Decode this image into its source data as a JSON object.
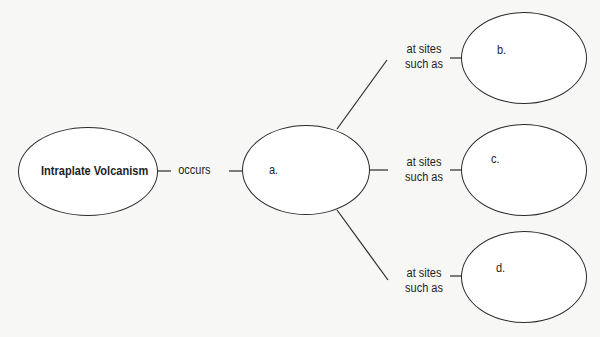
{
  "diagram": {
    "type": "concept-map",
    "colors": {
      "background": "#f7f7f5",
      "node_fill": "#ffffff",
      "stroke": "#2a2a2a",
      "text": "#1e1e1e"
    },
    "root": {
      "id": "root",
      "label": "Intraplate Volcanism"
    },
    "links": {
      "occurs": "occurs",
      "sites_b_line1": "at sites",
      "sites_b_line2": "such as",
      "sites_c_line1": "at sites",
      "sites_c_line2": "such as",
      "sites_d_line1": "at sites",
      "sites_d_line2": "such as"
    },
    "nodes": {
      "a": {
        "label": "a."
      },
      "b": {
        "label": "b."
      },
      "c": {
        "label": "c."
      },
      "d": {
        "label": "d."
      }
    },
    "edges": [
      {
        "from": "root",
        "to": "a",
        "label": "occurs"
      },
      {
        "from": "a",
        "to": "b",
        "label": "at sites such as"
      },
      {
        "from": "a",
        "to": "c",
        "label": "at sites such as"
      },
      {
        "from": "a",
        "to": "d",
        "label": "at sites such as"
      }
    ]
  }
}
